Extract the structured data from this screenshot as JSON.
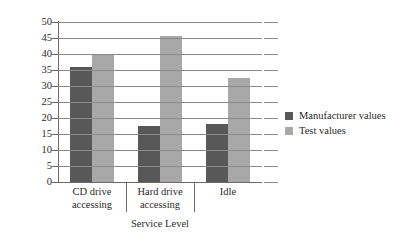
{
  "chart_data": {
    "type": "bar",
    "title": "",
    "xlabel": "Service Level",
    "ylabel": "",
    "categories": [
      "CD drive accessing",
      "Hard drive accessing",
      "Idle"
    ],
    "category_lines": [
      [
        "CD drive",
        "accessing"
      ],
      [
        "Hard drive",
        "accessing"
      ],
      [
        "Idle",
        ""
      ]
    ],
    "series": [
      {
        "name": "Manufacturer values",
        "color": "#585858",
        "values": [
          36,
          17.5,
          18
        ]
      },
      {
        "name": "Test values",
        "color": "#a8a8a8",
        "values": [
          40,
          45.5,
          32.5
        ]
      }
    ],
    "ylim": [
      0,
      50
    ],
    "ytick_step": 5,
    "yticks": [
      "0",
      "5",
      "10",
      "15",
      "20",
      "25",
      "30",
      "35",
      "40",
      "45",
      "50"
    ],
    "grid": true,
    "grid_axis": "y",
    "legend_position": "right",
    "legend": [
      "Manufacturer values",
      "Test values"
    ]
  },
  "colors": {
    "manufacturer": "#585858",
    "test": "#a8a8a8",
    "gridline": "#8a8a8a",
    "axis": "#6b6b6b",
    "text": "#2b2b2b",
    "background": "#ffffff"
  }
}
